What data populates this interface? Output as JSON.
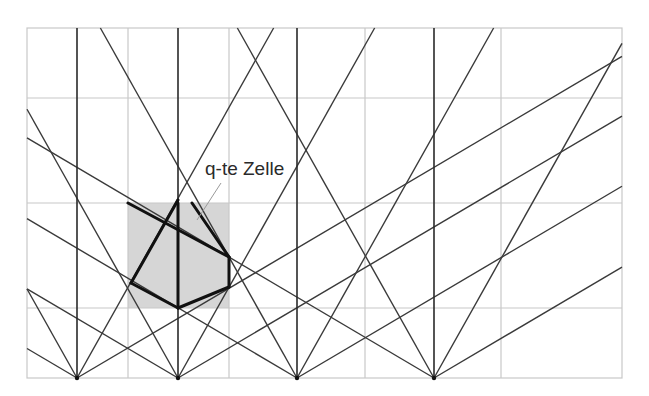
{
  "diagram": {
    "label": "q-te Zelle",
    "frame": {
      "x0": 27,
      "y0": 28,
      "x1": 622,
      "y1": 378
    },
    "grid": {
      "verticals": [
        128,
        229,
        365,
        501
      ],
      "horizontals": [
        98,
        203,
        308
      ],
      "color": "#c8c8c8"
    },
    "apexes": [
      {
        "x": 77,
        "y": 378
      },
      {
        "x": 178,
        "y": 378
      },
      {
        "x": 297,
        "y": 378
      },
      {
        "x": 434,
        "y": 378
      }
    ],
    "slopes": {
      "steep": 1.78,
      "shallow": 0.59
    },
    "line_color": "#3a3a3a",
    "highlight_cell": {
      "x": 128,
      "y": 203,
      "width": 101,
      "height": 105,
      "fill": "#d6d6d6"
    },
    "cell_outline": [
      {
        "x1": 131,
        "y1": 283,
        "x2": 178,
        "y2": 200
      },
      {
        "x1": 128,
        "y1": 203,
        "x2": 229,
        "y2": 257
      },
      {
        "x1": 192,
        "y1": 203,
        "x2": 229,
        "y2": 257
      },
      {
        "x1": 178,
        "y1": 203,
        "x2": 178,
        "y2": 308
      },
      {
        "x1": 131,
        "y1": 283,
        "x2": 178,
        "y2": 308
      },
      {
        "x1": 178,
        "y1": 308,
        "x2": 229,
        "y2": 287
      },
      {
        "x1": 229,
        "y1": 287,
        "x2": 229,
        "y2": 257
      }
    ],
    "leader": {
      "x1": 221,
      "y1": 183,
      "x2": 197,
      "y2": 220,
      "color": "#9a9a9a"
    },
    "label_pos": {
      "x": 205,
      "y": 158
    }
  }
}
